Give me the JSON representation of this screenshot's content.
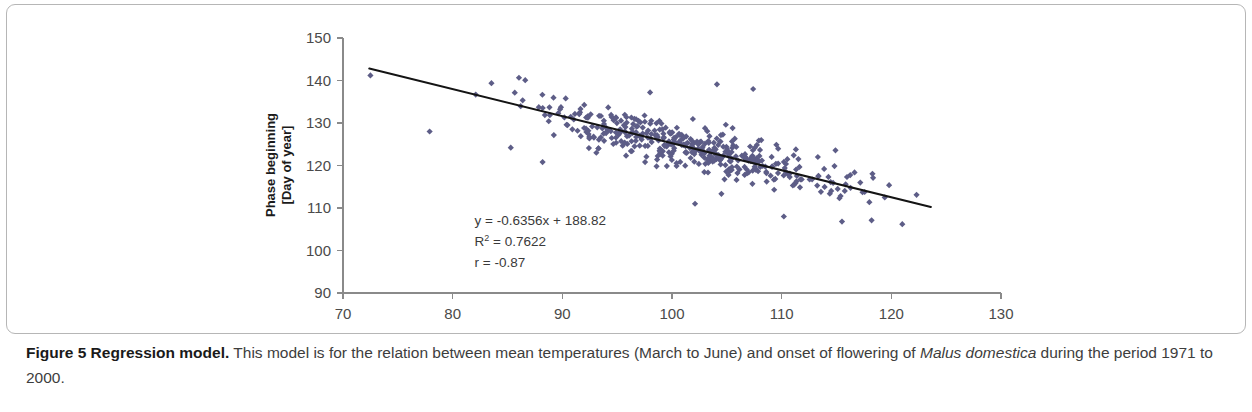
{
  "figure": {
    "caption_bold": "Figure 5 Regression model.",
    "caption_rest_1": " This model is for the relation between mean temperatures (March to June) and onset of flowering of ",
    "caption_italic_1": "Malus domestica",
    "caption_rest_2": " during the period 1971 to 2000."
  },
  "chart_data": {
    "type": "scatter",
    "title": "",
    "xlabel": "Temperature [°C/10]",
    "ylabel_line1": "Phase beginning",
    "ylabel_line2": "[Day of year]",
    "xlim": [
      70,
      130
    ],
    "ylim": [
      90,
      150
    ],
    "xticks": [
      70,
      80,
      90,
      100,
      110,
      120,
      130
    ],
    "yticks": [
      90,
      100,
      110,
      120,
      130,
      140,
      150
    ],
    "grid": false,
    "legend": null,
    "marker": "diamond",
    "marker_color": "#5d5d87",
    "marker_size": 5,
    "annotations": {
      "equation": "y = -0.6356x + 188.82",
      "r_squared_base": "R",
      "r_squared_exp": "2",
      "r_squared_value": " = 0.7622",
      "correlation": "r = -0.87",
      "x": 82,
      "y": 106
    },
    "regression": {
      "slope": -0.6356,
      "intercept": 188.82,
      "r_squared": 0.7622,
      "r": -0.87,
      "x_start": 72.4,
      "x_end": 123.6,
      "color": "#141414"
    },
    "n_points": 430,
    "x_mean": 101.5,
    "x_sd": 7.6,
    "x_min": 72.4,
    "x_max": 123.6,
    "residual_sd": 2.45,
    "seed": 20714,
    "outliers": [
      {
        "x": 77.9,
        "y": 128.0
      },
      {
        "x": 85.3,
        "y": 124.2
      },
      {
        "x": 102.1,
        "y": 111.0
      },
      {
        "x": 98.0,
        "y": 137.2
      },
      {
        "x": 107.4,
        "y": 138.0
      },
      {
        "x": 104.1,
        "y": 139.1
      },
      {
        "x": 72.5,
        "y": 141.2
      },
      {
        "x": 93.1,
        "y": 123.0
      },
      {
        "x": 113.3,
        "y": 122.0
      },
      {
        "x": 118.2,
        "y": 107.1
      },
      {
        "x": 121.0,
        "y": 106.2
      },
      {
        "x": 115.5,
        "y": 106.8
      },
      {
        "x": 122.3,
        "y": 113.1
      },
      {
        "x": 119.4,
        "y": 112.5
      },
      {
        "x": 110.2,
        "y": 108.0
      },
      {
        "x": 111.1,
        "y": 122.4
      },
      {
        "x": 88.2,
        "y": 120.8
      }
    ]
  }
}
